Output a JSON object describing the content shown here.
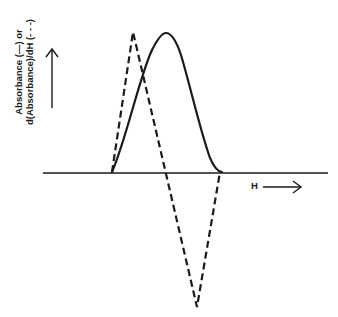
{
  "figure": {
    "ylabel_line1": "Absorbance (—) or",
    "ylabel_line2": "d(Absorbance)/dH (- - -)",
    "xlabel": "H",
    "colors": {
      "line": "#1a1a1a",
      "background": "#ffffff"
    }
  },
  "curves": {
    "absorbance": {
      "style": "solid",
      "description": "bell-shaped absorption peak",
      "start_x": 112,
      "peak": [
        166,
        33
      ],
      "end_x": 220
    },
    "derivative": {
      "style": "dashed",
      "description": "first derivative of absorbance",
      "points": [
        [
          112,
          172
        ],
        [
          133,
          32
        ],
        [
          197,
          307
        ],
        [
          220,
          172
        ]
      ]
    }
  }
}
